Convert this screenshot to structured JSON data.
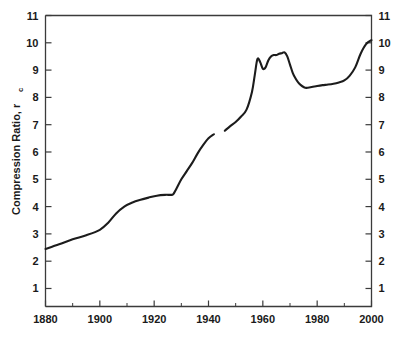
{
  "chart_data": {
    "type": "line",
    "title": "",
    "xlabel": "",
    "ylabel": "Compression Ratio, r",
    "ylabel_subscript": "c",
    "xlim": [
      1880,
      2000
    ],
    "ylim": [
      0.34,
      11
    ],
    "grid": false,
    "legend": null,
    "x_ticks_major": [
      1880,
      1900,
      1920,
      1940,
      1960,
      1980,
      2000
    ],
    "x_ticklabels": [
      "1880",
      "1900",
      "1920",
      "1940",
      "1960",
      "1980",
      "2000"
    ],
    "x_ticks_minor": [
      1890,
      1910,
      1930,
      1950,
      1970,
      1990
    ],
    "y_ticks_major": [
      1,
      2,
      3,
      4,
      5,
      6,
      7,
      8,
      9,
      10,
      11
    ],
    "y_ticklabels_left": [
      "1",
      "2",
      "3",
      "4",
      "5",
      "6",
      "7",
      "8",
      "9",
      "10",
      "11"
    ],
    "y_ticklabels_right": [
      "1",
      "2",
      "3",
      "4",
      "5",
      "6",
      "7",
      "8",
      "9",
      "10",
      "11"
    ],
    "line_color": "#1c1c1c",
    "axis_color": "#3b3b3b",
    "series": [
      {
        "name": "compression-ratio-pre-war",
        "x": [
          1880,
          1885,
          1890,
          1895,
          1900,
          1903,
          1906,
          1909,
          1912,
          1915,
          1918,
          1921,
          1924,
          1926,
          1927,
          1928,
          1930,
          1932,
          1934,
          1936,
          1938,
          1940,
          1942
        ],
        "y": [
          2.45,
          2.62,
          2.8,
          2.95,
          3.15,
          3.4,
          3.75,
          4.0,
          4.15,
          4.25,
          4.33,
          4.4,
          4.43,
          4.43,
          4.45,
          4.62,
          5.0,
          5.3,
          5.6,
          5.95,
          6.25,
          6.5,
          6.65
        ]
      },
      {
        "name": "compression-ratio-post-war",
        "x": [
          1946,
          1948,
          1950,
          1952,
          1954,
          1956,
          1957,
          1958,
          1959,
          1960,
          1961,
          1962,
          1963,
          1964,
          1965,
          1966,
          1967,
          1968,
          1969,
          1970,
          1971,
          1972,
          1973,
          1974,
          1975,
          1976,
          1978,
          1980,
          1982,
          1984,
          1986,
          1988,
          1990,
          1992,
          1994,
          1996,
          1998,
          2000
        ],
        "y": [
          6.78,
          6.95,
          7.1,
          7.3,
          7.55,
          8.2,
          8.8,
          9.4,
          9.3,
          9.05,
          9.1,
          9.35,
          9.5,
          9.55,
          9.55,
          9.6,
          9.62,
          9.65,
          9.5,
          9.2,
          8.9,
          8.7,
          8.55,
          8.45,
          8.38,
          8.35,
          8.38,
          8.42,
          8.45,
          8.47,
          8.5,
          8.55,
          8.62,
          8.8,
          9.1,
          9.6,
          9.95,
          10.1
        ]
      }
    ]
  }
}
